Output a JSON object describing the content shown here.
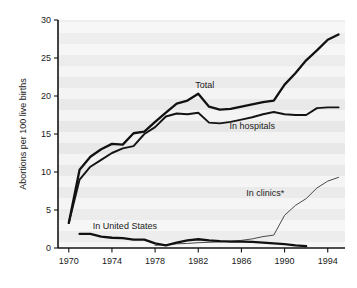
{
  "chart_data": {
    "type": "line",
    "title": "",
    "subtitle": "",
    "xlabel": "",
    "ylabel": "Abortions per 100 live births",
    "xlim": [
      1969,
      1995.6
    ],
    "ylim": [
      0,
      30
    ],
    "grid": false,
    "grid_note": "horizontal light-gray banding is a scan artifact, not gridlines",
    "legend_position": "inline-annotations",
    "xticks": [
      1970,
      1974,
      1978,
      1982,
      1986,
      1990,
      1994
    ],
    "xtick_labels": [
      "1970",
      "1974",
      "1978",
      "1982",
      "1986",
      "1990",
      "1994"
    ],
    "yticks": [
      0,
      5,
      10,
      15,
      20,
      25,
      30
    ],
    "ytick_labels": [
      "0",
      "5",
      "10",
      "15",
      "20",
      "25",
      "30"
    ],
    "annotations": [
      {
        "text": "Total",
        "x": 1982.6,
        "y": 21.0
      },
      {
        "text": "In hospitals",
        "x": 1987.0,
        "y": 15.6
      },
      {
        "text": "In clinics*",
        "x": 1988.2,
        "y": 6.9
      },
      {
        "text": "In United States",
        "x": 1975.2,
        "y": 2.5
      }
    ],
    "footnote": "*",
    "series": [
      {
        "name": "Total",
        "label": "Total",
        "style": "thick",
        "x": [
          1970,
          1971,
          1972,
          1973,
          1974,
          1975,
          1976,
          1977,
          1978,
          1979,
          1980,
          1981,
          1982,
          1983,
          1984,
          1985,
          1986,
          1987,
          1988,
          1989,
          1990,
          1991,
          1992,
          1993,
          1994,
          1995
        ],
        "values": [
          3.3,
          10.3,
          12.0,
          13.0,
          13.7,
          13.6,
          15.1,
          15.3,
          16.6,
          17.8,
          19.0,
          19.4,
          20.3,
          18.6,
          18.2,
          18.3,
          18.6,
          18.9,
          19.2,
          19.4,
          21.5,
          23.0,
          24.7,
          26.0,
          27.4,
          28.1
        ]
      },
      {
        "name": "In hospitals",
        "label": "In hospitals",
        "style": "medium",
        "x": [
          1970,
          1971,
          1972,
          1973,
          1974,
          1975,
          1976,
          1977,
          1978,
          1979,
          1980,
          1981,
          1982,
          1983,
          1984,
          1985,
          1986,
          1987,
          1988,
          1989,
          1990,
          1991,
          1992,
          1993,
          1994,
          1995
        ],
        "values": [
          3.3,
          9.0,
          10.7,
          11.6,
          12.5,
          13.1,
          13.4,
          15.0,
          15.9,
          17.3,
          17.7,
          17.6,
          17.8,
          16.5,
          16.4,
          16.6,
          16.9,
          17.2,
          17.6,
          17.9,
          17.6,
          17.5,
          17.5,
          18.4,
          18.5,
          18.5
        ]
      },
      {
        "name": "In clinics*",
        "label": "In clinics*",
        "style": "thin",
        "x": [
          1978,
          1979,
          1980,
          1981,
          1982,
          1983,
          1984,
          1985,
          1986,
          1987,
          1988,
          1989,
          1990,
          1991,
          1992,
          1993,
          1994,
          1995
        ],
        "values": [
          0.35,
          0.45,
          0.55,
          0.6,
          0.7,
          0.75,
          0.8,
          0.9,
          1.0,
          1.2,
          1.5,
          1.7,
          4.3,
          5.6,
          6.5,
          7.9,
          8.8,
          9.3
        ]
      },
      {
        "name": "In United States",
        "label": "In United States",
        "style": "thick",
        "x": [
          1971,
          1972,
          1973,
          1974,
          1975,
          1976,
          1977,
          1978,
          1979,
          1980,
          1981,
          1982,
          1983,
          1984,
          1985,
          1986,
          1987,
          1988,
          1989,
          1990,
          1991,
          1992
        ],
        "values": [
          1.85,
          1.85,
          1.5,
          1.35,
          1.3,
          1.1,
          1.1,
          0.6,
          0.35,
          0.7,
          1.0,
          1.15,
          1.0,
          0.9,
          0.85,
          0.85,
          0.8,
          0.7,
          0.6,
          0.5,
          0.35,
          0.25
        ]
      }
    ]
  }
}
